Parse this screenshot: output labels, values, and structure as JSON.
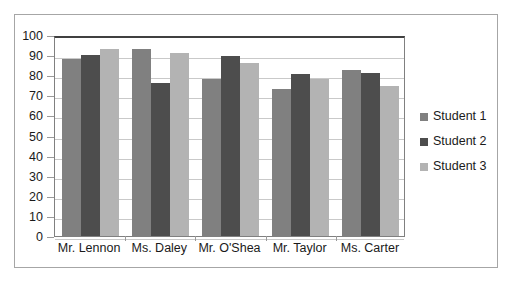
{
  "chart_data": {
    "type": "bar",
    "title": "",
    "xlabel": "",
    "ylabel": "",
    "ylim": [
      0,
      100
    ],
    "ytick_step": 10,
    "yticks": [
      "100",
      "90",
      "80",
      "70",
      "60",
      "50",
      "40",
      "30",
      "20",
      "10",
      "0"
    ],
    "grid": true,
    "legend_position": "right",
    "categories": [
      "Mr. Lennon",
      "Ms. Daley",
      "Mr. O'Shea",
      "Mr. Taylor",
      "Ms. Carter"
    ],
    "series": [
      {
        "name": "Student 1",
        "color": "#808080",
        "values": [
          88,
          93,
          78,
          73,
          82.5
        ]
      },
      {
        "name": "Student 2",
        "color": "#4d4d4d",
        "values": [
          90,
          76,
          89.5,
          80.5,
          81
        ]
      },
      {
        "name": "Student 3",
        "color": "#b3b3b3",
        "values": [
          93,
          91,
          86,
          78,
          74.5
        ]
      }
    ]
  },
  "colors": {
    "frame_border": "#a6a6a6",
    "plot_border": "#808080",
    "gridline": "#c9c9c9",
    "axis_top": "#404040",
    "text": "#1a1a1a"
  }
}
